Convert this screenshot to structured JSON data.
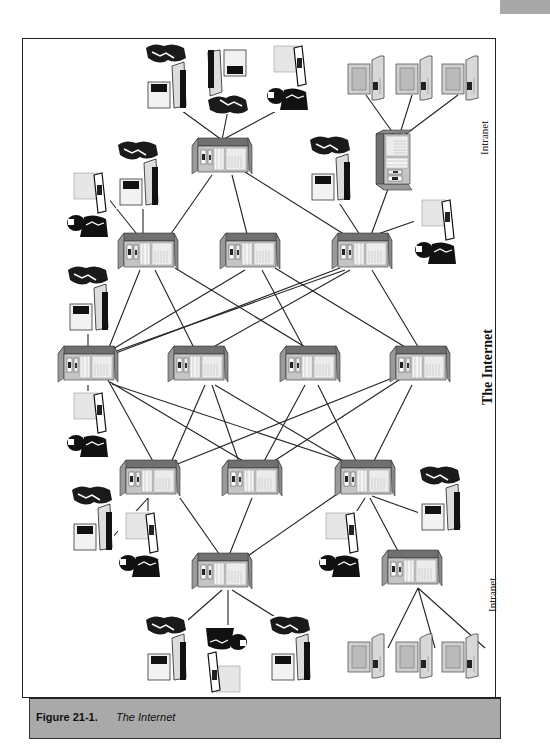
{
  "figure": {
    "number": "Figure 21-1.",
    "title": "The Internet"
  },
  "labels": {
    "center": "The Internet",
    "intranet_top": "Intranet",
    "intranet_bottom": "Intranet"
  },
  "colors": {
    "server_top": "#6e6e6e",
    "server_front": "#b5b5b5",
    "server_side": "#8a8a8a",
    "line": "#222222",
    "caption_bg": "#a9a9a9"
  },
  "nodes": {
    "servers": [
      {
        "id": "top-hub",
        "x": 222,
        "y": 160
      },
      {
        "id": "intranet-top-hub",
        "x": 398,
        "y": 160
      },
      {
        "id": "r1-a",
        "x": 148,
        "y": 255
      },
      {
        "id": "r1-b",
        "x": 250,
        "y": 255
      },
      {
        "id": "r1-c",
        "x": 362,
        "y": 255
      },
      {
        "id": "r2-d",
        "x": 88,
        "y": 368
      },
      {
        "id": "r2-e",
        "x": 198,
        "y": 368
      },
      {
        "id": "r2-f",
        "x": 310,
        "y": 368
      },
      {
        "id": "r2-g",
        "x": 420,
        "y": 368
      },
      {
        "id": "r3-h",
        "x": 150,
        "y": 482
      },
      {
        "id": "r3-i",
        "x": 252,
        "y": 482
      },
      {
        "id": "r3-j",
        "x": 365,
        "y": 482
      },
      {
        "id": "bottom-hub",
        "x": 222,
        "y": 575
      },
      {
        "id": "intranet-bottom-hub",
        "x": 412,
        "y": 572
      }
    ],
    "users_count": 16,
    "workstations_count": 6
  }
}
